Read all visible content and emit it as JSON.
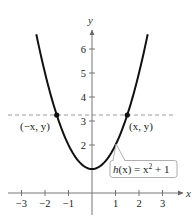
{
  "chart_data": {
    "type": "line",
    "title": "",
    "xlabel": "x",
    "ylabel": "y",
    "xlim": [
      -3.3,
      3.8
    ],
    "ylim": [
      -0.6,
      6.9
    ],
    "x_ticks": [
      -3,
      -2,
      -1,
      1,
      2,
      3
    ],
    "x_tick_labels": [
      "−3",
      "−2",
      "−1",
      "1",
      "2",
      "3"
    ],
    "y_ticks": [
      2,
      3,
      4,
      5,
      6
    ],
    "y_tick_labels": [
      "2",
      "3",
      "4",
      "5",
      "6"
    ],
    "grid": false,
    "series": [
      {
        "name": "h(x) = x^2 + 1",
        "function": "x^2 + 1",
        "x_range": [
          -2.37,
          2.37
        ],
        "x": [
          -2.37,
          -2,
          -1.5,
          -1,
          -0.5,
          0,
          0.5,
          1,
          1.5,
          2,
          2.37
        ],
        "y": [
          6.62,
          5,
          3.25,
          2,
          1.25,
          1,
          1.25,
          2,
          3.25,
          5,
          6.62
        ],
        "color": "#111111"
      }
    ],
    "reference_lines": [
      {
        "type": "horizontal",
        "y": 3.25,
        "style": "dashed",
        "color": "#999999"
      }
    ],
    "points": [
      {
        "x": -1.5,
        "y": 3.25,
        "label": "(−x, y)"
      },
      {
        "x": 1.5,
        "y": 3.25,
        "label": "(x, y)"
      }
    ],
    "annotations": [
      {
        "text": "h(x) = x² + 1",
        "type": "callout",
        "points_to": {
          "x": 1.05,
          "y": 2.1
        }
      }
    ]
  },
  "labels": {
    "x_axis": "x",
    "y_axis": "y",
    "point_left": "(−x, y)",
    "point_right": "(x, y)",
    "callout_func": "h",
    "callout_arg": "(x) = x",
    "callout_exp": "2",
    "callout_tail": " + 1"
  }
}
